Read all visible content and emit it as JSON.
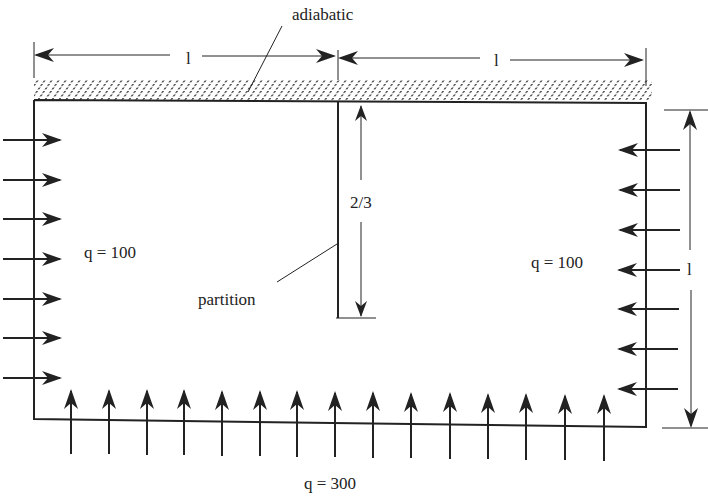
{
  "diagram": {
    "type": "heat-transfer-boundary-conditions",
    "labels": {
      "adiabatic": "adiabatic",
      "partition": "partition",
      "left_flux": "q = 100",
      "right_flux": "q = 100",
      "bottom_flux": "q = 300",
      "partition_height": "2/3",
      "left_width": "l",
      "right_width": "l",
      "height": "l"
    },
    "boundaries": {
      "top": "adiabatic (hatched)",
      "left": {
        "flux": 100,
        "arrow_count": 7,
        "direction": "inward"
      },
      "right": {
        "flux": 100,
        "arrow_count": 7,
        "direction": "inward"
      },
      "bottom": {
        "flux": 300,
        "arrow_count": 15,
        "direction": "inward"
      }
    },
    "colors": {
      "line": "#222222",
      "background": "#ffffff"
    }
  }
}
